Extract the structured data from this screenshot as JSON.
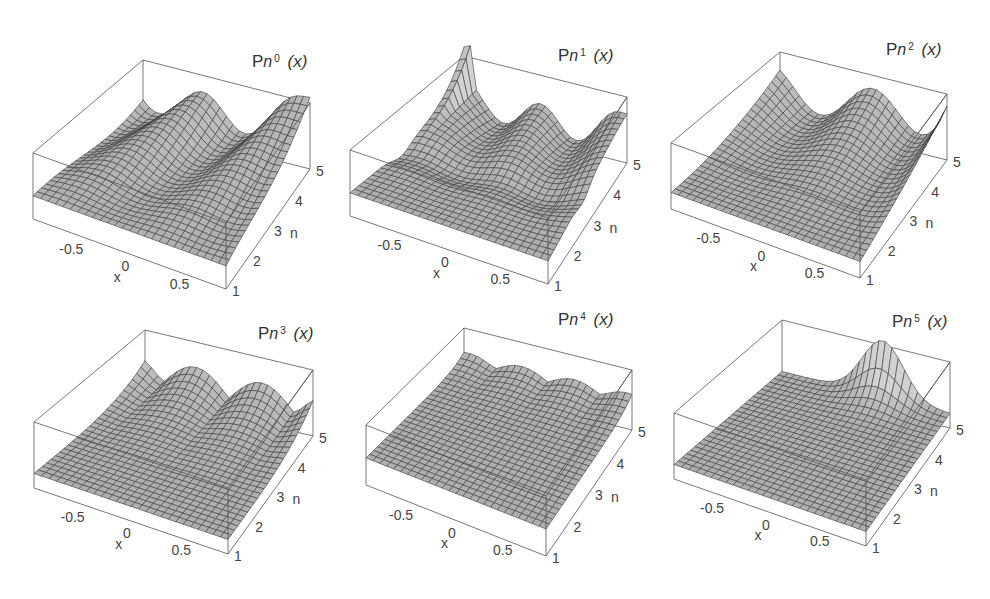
{
  "chart_data": [
    {
      "type": "surface3d",
      "title": "Pn0(x)",
      "title_parts": {
        "base": "P",
        "sub": "n",
        "sup": "0",
        "arg": "(x)"
      },
      "xlabel": "x",
      "ylabel": "n",
      "x_ticks": [
        "-0.5",
        "0",
        "0.5"
      ],
      "n_ticks": [
        "1",
        "2",
        "3",
        "4",
        "5"
      ],
      "xlim": [
        -1,
        1
      ],
      "nlim": [
        1,
        5
      ],
      "description": "Rolling surface with oscillating ridges; rises steeply toward x=1 edge at high n"
    },
    {
      "type": "surface3d",
      "title": "Pn1(x)",
      "title_parts": {
        "base": "P",
        "sub": "n",
        "sup": "1",
        "arg": "(x)"
      },
      "xlabel": "x",
      "ylabel": "n",
      "x_ticks": [
        "-0.5",
        "0",
        "0.5"
      ],
      "n_ticks": [
        "1",
        "2",
        "3",
        "4",
        "5"
      ],
      "xlim": [
        -1,
        1
      ],
      "nlim": [
        1,
        5
      ],
      "description": "Sharp spike near x=-1 at high n; dark trough crossing diagonally"
    },
    {
      "type": "surface3d",
      "title": "Pn2(x)",
      "title_parts": {
        "base": "P",
        "sub": "n",
        "sup": "2",
        "arg": "(x)"
      },
      "xlabel": "x",
      "ylabel": "n",
      "x_ticks": [
        "-0.5",
        "0",
        "0.5"
      ],
      "n_ticks": [
        "1",
        "2",
        "3",
        "4",
        "5"
      ],
      "xlim": [
        -1,
        1
      ],
      "nlim": [
        1,
        5
      ],
      "description": "Flat for low n, ridges emerge at high n"
    },
    {
      "type": "surface3d",
      "title": "Pn3(x)",
      "title_parts": {
        "base": "P",
        "sub": "n",
        "sup": "3",
        "arg": "(x)"
      },
      "xlabel": "x",
      "ylabel": "n",
      "x_ticks": [
        "-0.5",
        "0",
        "0.5"
      ],
      "n_ticks": [
        "1",
        "2",
        "3",
        "4",
        "5"
      ],
      "xlim": [
        -1,
        1
      ],
      "nlim": [
        1,
        5
      ],
      "description": "Flat plane except two peaks at n=4-5"
    },
    {
      "type": "surface3d",
      "title": "Pn4(x)",
      "title_parts": {
        "base": "P",
        "sub": "n",
        "sup": "4",
        "arg": "(x)"
      },
      "xlabel": "x",
      "ylabel": "n",
      "x_ticks": [
        "-0.5",
        "0",
        "0.5"
      ],
      "n_ticks": [
        "1",
        "2",
        "3",
        "4",
        "5"
      ],
      "xlim": [
        -1,
        1
      ],
      "nlim": [
        1,
        5
      ],
      "description": "Nearly flat plane with small ripple at n=5"
    },
    {
      "type": "surface3d",
      "title": "Pn5(x)",
      "title_parts": {
        "base": "P",
        "sub": "n",
        "sup": "5",
        "arg": "(x)"
      },
      "xlabel": "x",
      "ylabel": "n",
      "x_ticks": [
        "-0.5",
        "0",
        "0.5"
      ],
      "n_ticks": [
        "1",
        "2",
        "3",
        "4",
        "5"
      ],
      "xlim": [
        -1,
        1
      ],
      "nlim": [
        1,
        5
      ],
      "description": "Flat zero plane with a single bell-shaped hump along n=5"
    }
  ],
  "colors": {
    "surface": "#b9b9b9",
    "mesh": "#3a3a3a",
    "box": "#555555",
    "text": "#333333"
  }
}
